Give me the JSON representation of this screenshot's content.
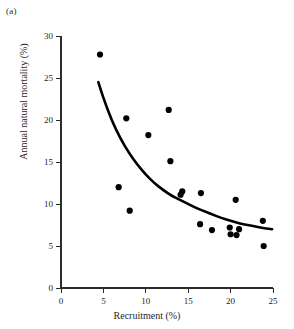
{
  "panel": {
    "label": "(a)"
  },
  "chart_data": {
    "type": "scatter",
    "title": "",
    "xlabel": "Recruitment (%)",
    "ylabel": "Annual natural mortality (%)",
    "xlim": [
      0,
      25
    ],
    "ylim": [
      0,
      30
    ],
    "xticks": [
      0,
      5,
      10,
      15,
      20,
      25
    ],
    "yticks": [
      0,
      5,
      10,
      15,
      20,
      25,
      30
    ],
    "xticklabels": [
      "0",
      "5",
      "10",
      "15",
      "20",
      "25"
    ],
    "yticklabels": [
      "0",
      "5",
      "10",
      "15",
      "20",
      "25",
      "30"
    ],
    "grid": false,
    "legend": null,
    "series": [
      {
        "name": "observations",
        "marker": "filled-circle",
        "color": "#000000",
        "points": [
          {
            "x": 4.6,
            "y": 27.8
          },
          {
            "x": 6.8,
            "y": 12.0
          },
          {
            "x": 7.7,
            "y": 20.2
          },
          {
            "x": 8.1,
            "y": 9.2
          },
          {
            "x": 10.3,
            "y": 18.2
          },
          {
            "x": 12.7,
            "y": 21.2
          },
          {
            "x": 12.9,
            "y": 15.1
          },
          {
            "x": 14.1,
            "y": 11.1
          },
          {
            "x": 14.3,
            "y": 11.5
          },
          {
            "x": 16.5,
            "y": 11.3
          },
          {
            "x": 16.4,
            "y": 7.6
          },
          {
            "x": 17.8,
            "y": 6.9
          },
          {
            "x": 19.9,
            "y": 7.2
          },
          {
            "x": 20.0,
            "y": 6.4
          },
          {
            "x": 20.6,
            "y": 10.5
          },
          {
            "x": 20.7,
            "y": 6.3
          },
          {
            "x": 21.0,
            "y": 7.0
          },
          {
            "x": 23.8,
            "y": 8.0
          },
          {
            "x": 23.9,
            "y": 5.0
          }
        ]
      }
    ],
    "fit_curve": {
      "name": "fitted-decay-curve",
      "color": "#000000",
      "points": [
        {
          "x": 4.4,
          "y": 24.5
        },
        {
          "x": 5.0,
          "y": 22.6
        },
        {
          "x": 6.0,
          "y": 19.9
        },
        {
          "x": 7.0,
          "y": 17.8
        },
        {
          "x": 8.0,
          "y": 16.1
        },
        {
          "x": 9.0,
          "y": 14.7
        },
        {
          "x": 10.0,
          "y": 13.5
        },
        {
          "x": 11.0,
          "y": 12.5
        },
        {
          "x": 12.0,
          "y": 11.7
        },
        {
          "x": 13.0,
          "y": 11.0
        },
        {
          "x": 14.0,
          "y": 10.5
        },
        {
          "x": 15.0,
          "y": 10.0
        },
        {
          "x": 16.0,
          "y": 9.5
        },
        {
          "x": 17.0,
          "y": 9.1
        },
        {
          "x": 18.0,
          "y": 8.7
        },
        {
          "x": 19.0,
          "y": 8.3
        },
        {
          "x": 20.0,
          "y": 8.0
        },
        {
          "x": 21.0,
          "y": 7.7
        },
        {
          "x": 22.0,
          "y": 7.5
        },
        {
          "x": 23.0,
          "y": 7.3
        },
        {
          "x": 24.0,
          "y": 7.1
        },
        {
          "x": 24.9,
          "y": 7.0
        }
      ]
    }
  }
}
